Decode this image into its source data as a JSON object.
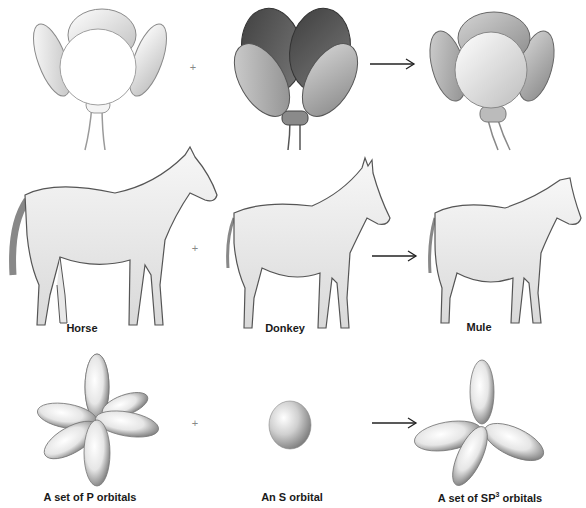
{
  "diagram": {
    "operators": {
      "plus": "+",
      "arrow": "→"
    },
    "rows": [
      {
        "name": "flowers",
        "items": [
          {
            "id": "white-flower",
            "label": "",
            "shade": "#f2f2f2"
          },
          {
            "id": "dark-flower",
            "label": "",
            "shade": "#5a5a5a"
          },
          {
            "id": "hybrid-flower",
            "label": "",
            "shade": "#a8a8a8"
          }
        ]
      },
      {
        "name": "equines",
        "items": [
          {
            "id": "horse",
            "label": "Horse"
          },
          {
            "id": "donkey",
            "label": "Donkey"
          },
          {
            "id": "mule",
            "label": "Mule"
          }
        ]
      },
      {
        "name": "orbitals",
        "items": [
          {
            "id": "p-orbitals",
            "label": "A set of P orbitals"
          },
          {
            "id": "s-orbital",
            "label": "An S orbital"
          },
          {
            "id": "sp3-orbitals",
            "label_prefix": "A set of SP",
            "label_sup": "3",
            "label_suffix": " orbitals"
          }
        ]
      }
    ],
    "colors": {
      "line": "#333333",
      "label": "#1a1a1a",
      "shade_light": "#ffffff",
      "shade_dark": "#6e6e6e"
    }
  }
}
